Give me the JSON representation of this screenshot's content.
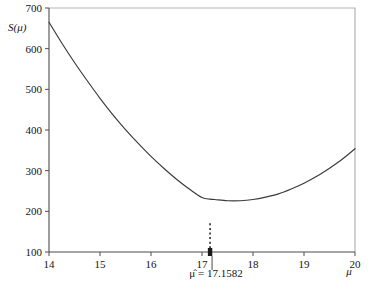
{
  "chart_data": {
    "type": "line",
    "title": "",
    "xlabel": "μ",
    "ylabel": "S(μ)",
    "xlim": [
      14,
      20
    ],
    "ylim": [
      100,
      700
    ],
    "xticks": [
      14,
      15,
      16,
      17,
      18,
      19,
      20
    ],
    "xtick_labels": [
      "14",
      "15",
      "16",
      "17",
      "18",
      "19",
      "20"
    ],
    "yticks": [
      100,
      200,
      300,
      400,
      500,
      600,
      700
    ],
    "ytick_labels": [
      "100",
      "200",
      "300",
      "400",
      "500",
      "600",
      "700"
    ],
    "grid": false,
    "legend": null,
    "curve_color": "#3a3a3a",
    "frame_color": "#b4b4b4",
    "axis_color": "#4d4d4d",
    "series": [
      {
        "name": "S(μ)",
        "x": [
          14.0,
          14.25,
          14.5,
          14.75,
          15.0,
          15.25,
          15.5,
          15.75,
          16.0,
          16.25,
          16.5,
          16.75,
          17.0,
          17.1582,
          17.25,
          17.5,
          17.75,
          18.0,
          18.25,
          18.5,
          18.75,
          19.0,
          19.25,
          19.5,
          19.75,
          20.0
        ],
        "y": [
          665,
          614,
          566,
          521,
          478,
          438,
          401,
          367,
          335,
          306,
          279,
          255,
          234,
          230,
          229,
          226,
          226,
          229,
          235,
          243,
          255,
          269,
          286,
          306,
          328,
          354
        ]
      }
    ],
    "annotations": [
      {
        "name": "mu-hat-annotation",
        "text": "μ̂ = 17.1582",
        "x": 17.1582,
        "y": 173,
        "marker": "filled-dot",
        "dropline": "dotted",
        "leader_line": true
      }
    ],
    "minimum": {
      "x": 17.1582,
      "y": 173
    }
  },
  "labels": {
    "y_axis_title": "S(μ)",
    "x_axis_title": "μ",
    "annotation": "μ̂ = 17.1582",
    "y_ticks": [
      "700",
      "600",
      "500",
      "400",
      "300",
      "200",
      "100"
    ],
    "x_ticks": [
      "14",
      "15",
      "16",
      "17",
      "18",
      "19",
      "20"
    ]
  }
}
